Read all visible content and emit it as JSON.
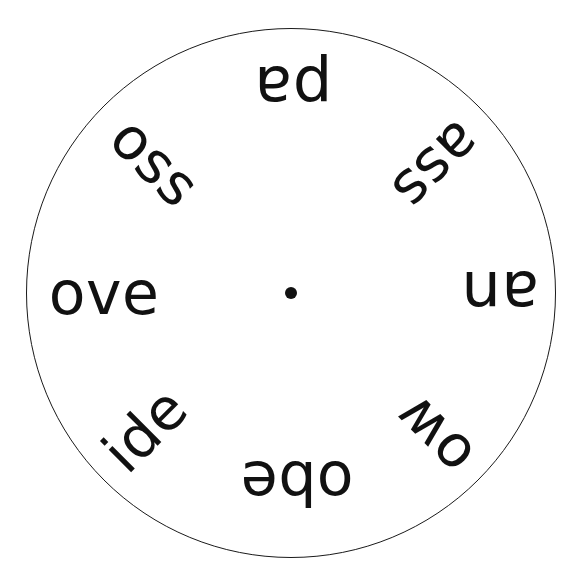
{
  "page": {
    "width": 568,
    "height": 585,
    "background_color": "#ffffff"
  },
  "wheel": {
    "center_x": 291,
    "center_y": 293,
    "radius": 265,
    "stroke_color": "#1a1a1a",
    "stroke_width": 1.5,
    "fill_color": "#ffffff",
    "hub": {
      "name": "center-dot",
      "diameter": 12,
      "color": "#111111"
    },
    "word_color": "#111111",
    "segment_count": 8,
    "words": [
      {
        "text": "pa",
        "position": "top",
        "angle_deg": 180,
        "anchor_x": 293,
        "anchor_y": 88,
        "font_size": 62
      },
      {
        "text": "ass",
        "position": "top-right",
        "angle_deg": 135,
        "anchor_x": 437,
        "anchor_y": 166,
        "font_size": 58
      },
      {
        "text": "an",
        "position": "right",
        "angle_deg": 180,
        "anchor_x": 500,
        "anchor_y": 293,
        "font_size": 62
      },
      {
        "text": "ow",
        "position": "bottom-right",
        "angle_deg": 225,
        "anchor_x": 434,
        "anchor_y": 436,
        "font_size": 58
      },
      {
        "text": "obe",
        "position": "bottom",
        "angle_deg": 180,
        "anchor_x": 297,
        "anchor_y": 483,
        "font_size": 60
      },
      {
        "text": "ide",
        "position": "bottom-left",
        "angle_deg": 315,
        "anchor_x": 145,
        "anchor_y": 430,
        "font_size": 58
      },
      {
        "text": "ove",
        "position": "left",
        "angle_deg": 0,
        "anchor_x": 104,
        "anchor_y": 293,
        "font_size": 60
      },
      {
        "text": "oss",
        "position": "top-left",
        "angle_deg": 45,
        "anchor_x": 155,
        "anchor_y": 162,
        "font_size": 58
      }
    ]
  }
}
